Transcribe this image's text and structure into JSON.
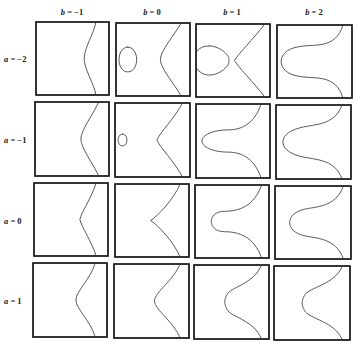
{
  "figure": {
    "column_labels": [
      {
        "var": "b",
        "eq": " = ",
        "value": "−1",
        "x": 72
      },
      {
        "var": "b",
        "eq": " = ",
        "value": "0",
        "x": 152
      },
      {
        "var": "b",
        "eq": " = ",
        "value": "1",
        "x": 232
      },
      {
        "var": "b",
        "eq": " = ",
        "value": "2",
        "x": 314
      }
    ],
    "row_labels": [
      {
        "var": "a",
        "eq": " = ",
        "value": "−2",
        "y": 59
      },
      {
        "var": "a",
        "eq": " = ",
        "value": "−1",
        "y": 140
      },
      {
        "var": "a",
        "eq": " = ",
        "value": "0",
        "y": 221
      },
      {
        "var": "a",
        "eq": " = ",
        "value": "1",
        "y": 301
      }
    ],
    "frames": [
      [
        [
          36,
          22,
          109,
          95
        ],
        [
          116,
          23,
          190,
          96
        ],
        [
          196,
          24,
          270,
          97
        ],
        [
          277,
          25,
          352,
          98
        ]
      ],
      [
        [
          35,
          102,
          109,
          176
        ],
        [
          115,
          103,
          190,
          177
        ],
        [
          196,
          104,
          270,
          178
        ],
        [
          276,
          105,
          351,
          179
        ]
      ],
      [
        [
          34,
          183,
          108,
          256
        ],
        [
          115,
          184,
          189,
          257
        ],
        [
          195,
          185,
          269,
          258
        ],
        [
          275,
          186,
          351,
          259
        ]
      ],
      [
        [
          33,
          263,
          107,
          337
        ],
        [
          114,
          264,
          189,
          338
        ],
        [
          194,
          265,
          269,
          339
        ],
        [
          274,
          266,
          350,
          340
        ]
      ]
    ],
    "curves": [
      [
        [
          "M0.04,0 C0.02,0.15 -0.12,0.35 -0.12,0.5 C-0.12,0.65 0.02,0.85 0.04,1 L0.04,1 M-0.86,0.42 C-0.9,0.42 -0.9,0.58 -0.86,0.58 C-0.82,0.58 -0.82,0.42 -0.86,0.42 Z"
        ],
        [
          "M0.1,0 C0.0,0.18 -0.18,0.38 -0.18,0.5 C-0.18,0.62 0.0,0.82 0.1,1 M-0.62,0.33 C-0.78,0.33 -0.78,0.67 -0.62,0.67 C-0.46,0.67 -0.46,0.33 -0.62,0.33 Z"
        ],
        [
          "M0.15,0 C0.0,0.2 -0.22,0.42 -0.26,0.5 C-0.22,0.58 0.0,0.8 0.15,1 M-0.6,0.3 C-0.9,0.3 -0.85,0.7 -0.6,0.7 C-0.45,0.7 -0.3,0.55 -0.34,0.5 C-0.3,0.45 -0.45,0.3 -0.6,0.3 Z"
        ],
        [
          "M0.1,0 C0.0,0.35 -0.3,0.25 -0.5,0.3 C-0.8,0.35 -0.8,0.65 -0.5,0.7 C-0.3,0.75 0.0,0.65 0.1,1"
        ]
      ],
      [
        [
          "M0.08,0 C0.0,0.18 -0.16,0.38 -0.16,0.5 C-0.16,0.62 0.0,0.82 0.08,1"
        ],
        [
          "M0.12,0 C0.02,0.2 -0.2,0.42 -0.22,0.5 C-0.2,0.58 0.02,0.8 0.12,1 M-0.68,0.42 C-0.76,0.42 -0.76,0.58 -0.68,0.58 C-0.6,0.58 -0.6,0.42 -0.68,0.42 Z"
        ],
        [
          "M0.1,0 C0.0,0.3 -0.2,0.35 -0.35,0.35 C-0.55,0.35 -0.7,0.42 -0.7,0.5 C-0.7,0.58 -0.55,0.65 -0.35,0.65 C-0.2,0.65 0.0,0.7 0.1,1"
        ],
        [
          "M0.1,0 C0.0,0.3 -0.3,0.25 -0.5,0.32 C-0.75,0.4 -0.75,0.6 -0.5,0.68 C-0.3,0.75 0.0,0.7 0.1,1"
        ]
      ],
      [
        [
          "M0.06,0 C0.0,0.2 -0.14,0.4 -0.16,0.5 C-0.14,0.6 0.0,0.8 0.06,1"
        ],
        [
          "M0.1,0 C0.02,0.2 -0.2,0.44 -0.3,0.5 C-0.2,0.56 0.02,0.8 0.1,1"
        ],
        [
          "M0.12,0 C0.02,0.3 -0.2,0.36 -0.38,0.36 C-0.62,0.36 -0.62,0.64 -0.38,0.64 C-0.2,0.64 0.02,0.7 0.12,1"
        ],
        [
          "M0.12,0 C0.02,0.3 -0.25,0.28 -0.4,0.32 C-0.65,0.38 -0.65,0.62 -0.4,0.68 C-0.25,0.72 0.02,0.7 0.12,1"
        ]
      ],
      [
        [
          "M0.06,0 C0.0,0.22 -0.2,0.38 -0.2,0.5 C-0.2,0.62 0.0,0.78 0.06,1"
        ],
        [
          "M0.1,0 C0.02,0.22 -0.24,0.38 -0.24,0.5 C-0.24,0.62 0.02,0.78 0.1,1"
        ],
        [
          "M0.12,0 C0.02,0.26 -0.3,0.3 -0.34,0.4 C-0.38,0.48 -0.38,0.52 -0.34,0.6 C-0.3,0.7 0.02,0.74 0.12,1"
        ],
        [
          "M0.12,0 C0.02,0.26 -0.32,0.28 -0.38,0.4 C-0.42,0.48 -0.42,0.52 -0.38,0.6 C-0.32,0.72 0.02,0.74 0.12,1"
        ]
      ]
    ]
  }
}
